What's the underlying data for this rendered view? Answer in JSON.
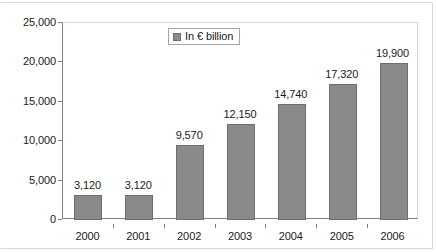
{
  "chart_data": {
    "type": "bar",
    "title": "",
    "subtitle": "",
    "xlabel": "",
    "ylabel": "",
    "categories": [
      "2000",
      "2001",
      "2002",
      "2003",
      "2004",
      "2005",
      "2006"
    ],
    "values": [
      3120,
      3120,
      9570,
      12150,
      14740,
      17320,
      19900
    ],
    "value_labels": [
      "3,120",
      "3,120",
      "9,570",
      "12,150",
      "14,740",
      "17,320",
      "19,900"
    ],
    "series": [
      {
        "name": "In € billion",
        "values": [
          3120,
          3120,
          9570,
          12150,
          14740,
          17320,
          19900
        ],
        "color": "#8a8a8a"
      }
    ],
    "ylim": [
      0,
      25000
    ],
    "ytick_values": [
      0,
      5000,
      10000,
      15000,
      20000,
      25000
    ],
    "ytick_labels": [
      "0",
      "5,000",
      "10,000",
      "15,000",
      "20,000",
      "25,000"
    ],
    "grid": false,
    "legend": {
      "position": "top-center",
      "entries": [
        {
          "label": "In € billion",
          "swatch_name": "legend-swatch-in-eur-billion",
          "color": "#8a8a8a"
        }
      ]
    },
    "colors": {
      "bar_fill": "#8a8a8a",
      "bar_stroke": "#6e6e6e",
      "axis": "#808080",
      "text": "#1a1a1a",
      "frame": "#d9d9d9",
      "background": "#ffffff"
    }
  }
}
